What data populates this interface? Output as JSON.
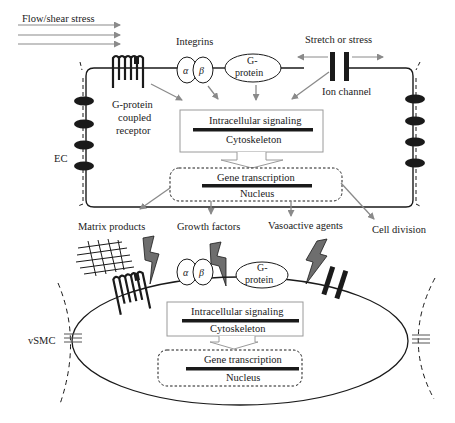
{
  "diagram": {
    "colors": {
      "line": "#1a1a1a",
      "arrow": "#8a8a8a",
      "box_border": "#9a9a9a",
      "bolt_fill": "#6e6e6e"
    },
    "ec": {
      "flow_label": "Flow/shear stress",
      "cell_label": "EC",
      "integrins_label": "Integrins",
      "alpha": "α",
      "beta": "β",
      "gprotein_line1": "G-",
      "gprotein_line2": "protein",
      "stretch_label": "Stretch or stress",
      "ion_channel_label": "Ion channel",
      "gpcr_line1": "G-protein",
      "gpcr_line2": "coupled",
      "gpcr_line3": "receptor",
      "signaling_label": "Intracellular signaling",
      "cytoskeleton_label": "Cytoskeleton",
      "gene_label": "Gene transcription",
      "nucleus_label": "Nucleus"
    },
    "outputs": {
      "matrix": "Matrix products",
      "growth": "Growth factors",
      "vasoactive": "Vasoactive agents",
      "division": "Cell division"
    },
    "vsmc": {
      "cell_label": "vSMC",
      "alpha": "α",
      "beta": "β",
      "gprotein_line1": "G-",
      "gprotein_line2": "protein",
      "signaling_label": "Intracellular signaling",
      "cytoskeleton_label": "Cytoskeleton",
      "gene_label": "Gene transcription",
      "nucleus_label": "Nucleus"
    }
  }
}
